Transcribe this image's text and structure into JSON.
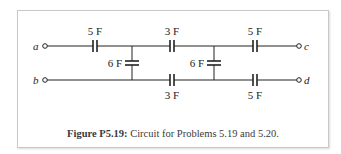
{
  "figure": {
    "caption_label": "Figure P5.19:",
    "caption_text": " Circuit for Problems 5.19 and 5.20."
  },
  "terminals": {
    "a": "a",
    "b": "b",
    "c": "c",
    "d": "d"
  },
  "capacitors": {
    "top_left": "5 F",
    "top_middle": "3 F",
    "top_right": "5 F",
    "shunt_left": "6 F",
    "shunt_right": "6 F",
    "bottom_middle": "3 F",
    "bottom_right": "5 F"
  }
}
